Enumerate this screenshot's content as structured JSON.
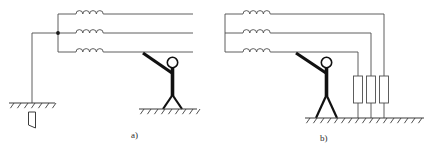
{
  "figure": {
    "panels": [
      {
        "id": "a",
        "caption": "a)",
        "description": "Three-phase winding with earthed neutral; person touching lower phase conductor while standing on earth",
        "elements": {
          "coil_count": 3,
          "coil_bumps": 4,
          "neutral_junction": "filled-dot",
          "earth_electrode": "ground-rod",
          "person": "stick-figure-touching-line"
        }
      },
      {
        "id": "b",
        "caption": "b)",
        "description": "Three-phase winding with each phase earthed through a resistor; person touching lower phase conductor while standing on earth",
        "elements": {
          "coil_count": 3,
          "coil_bumps": 4,
          "resistor_count": 3,
          "earth_bar": "hatched-ground-line",
          "person": "stick-figure-touching-line"
        }
      }
    ],
    "bottom_caption": "",
    "colors": {
      "conductor": "#4d4d4d",
      "body": "#111111",
      "ground": "#3d3d3d",
      "background": "#ffffff",
      "caption": "#2b2b2b"
    }
  }
}
